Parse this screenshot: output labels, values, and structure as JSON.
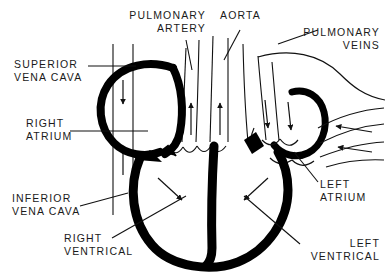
{
  "diagram": {
    "background_color": "#ffffff",
    "ink_color": "#000000",
    "labels": {
      "superior_vena_cava": "SUPERIOR\nVENA CAVA",
      "right_atrium": "RIGHT\nATRIUM",
      "inferior_vena_cava": "INFERIOR\nVENA CAVA",
      "right_ventrical": "RIGHT\nVENTRICAL",
      "pulmonary_artery": "PULMONARY\nARTERY",
      "aorta": "AORTA",
      "pulmonary_veins": "PULMONARY\nVEINS",
      "left_atrium": "LEFT\nATRIUM",
      "left_ventrical": "LEFT\nVENTRICAL"
    },
    "structures": [
      {
        "name": "superior-vena-cava",
        "flow": "down",
        "side": "right-heart"
      },
      {
        "name": "inferior-vena-cava",
        "flow": "up",
        "side": "right-heart"
      },
      {
        "name": "right-atrium",
        "flow": "in",
        "side": "right-heart"
      },
      {
        "name": "right-ventrical",
        "flow": "out",
        "side": "right-heart"
      },
      {
        "name": "pulmonary-artery",
        "flow": "up",
        "side": "right-heart"
      },
      {
        "name": "aorta",
        "flow": "up",
        "side": "left-heart"
      },
      {
        "name": "pulmonary-veins",
        "flow": "left",
        "side": "left-heart"
      },
      {
        "name": "left-atrium",
        "flow": "in",
        "side": "left-heart"
      },
      {
        "name": "left-ventrical",
        "flow": "out",
        "side": "left-heart"
      }
    ]
  }
}
